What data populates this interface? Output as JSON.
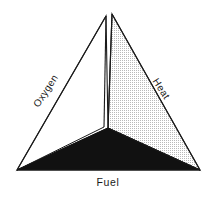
{
  "diagram": {
    "name": "fire-tetrahedron",
    "background_color": "#ffffff",
    "line_color": "#1a1a1a",
    "labels": {
      "left_edge": "Oxygen",
      "right_edge": "Heat",
      "bottom_edge": "Fuel"
    },
    "faces": {
      "left": {
        "name": "left-face",
        "fill": "#ffffff",
        "style": "plain"
      },
      "right": {
        "name": "right-face",
        "fill": "#ececec",
        "style": "stippled"
      },
      "bottom": {
        "name": "bottom-face",
        "fill": "#111111",
        "style": "solid"
      }
    },
    "vertices": {
      "apex_front": {
        "x": 112,
        "y": 14
      },
      "apex_back": {
        "x": 106,
        "y": 16
      },
      "bottom_left": {
        "x": 17,
        "y": 170
      },
      "bottom_right": {
        "x": 200,
        "y": 170
      },
      "center_front": {
        "x": 108,
        "y": 128
      }
    }
  }
}
